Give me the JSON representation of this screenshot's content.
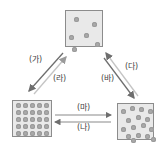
{
  "states": {
    "gas": {
      "name": "gas",
      "particles": [
        [
          8,
          6
        ],
        [
          26,
          11
        ],
        [
          3,
          24
        ],
        [
          18,
          22
        ],
        [
          6,
          36
        ],
        [
          29,
          31
        ]
      ]
    },
    "solid": {
      "name": "solid",
      "grid_rows": 5,
      "grid_cols": 5
    },
    "liquid": {
      "name": "liquid",
      "particles": [
        [
          4,
          6
        ],
        [
          13,
          3
        ],
        [
          22,
          4
        ],
        [
          31,
          6
        ],
        [
          9,
          15
        ],
        [
          19,
          12
        ],
        [
          28,
          14
        ],
        [
          4,
          24
        ],
        [
          14,
          22
        ],
        [
          24,
          20
        ],
        [
          32,
          24
        ],
        [
          9,
          31
        ],
        [
          19,
          30
        ],
        [
          28,
          31
        ],
        [
          14,
          35
        ],
        [
          34,
          34
        ]
      ]
    }
  },
  "transitions": {
    "ga": {
      "label": "(가)",
      "from": "gas",
      "to": "solid"
    },
    "ra": {
      "label": "(라)",
      "from": "solid",
      "to": "gas"
    },
    "da": {
      "label": "(다)",
      "from": "liquid",
      "to": "gas"
    },
    "ba": {
      "label": "(바)",
      "from": "gas",
      "to": "liquid"
    },
    "ma": {
      "label": "(마)",
      "from": "solid",
      "to": "liquid"
    },
    "na": {
      "label": "(나)",
      "from": "liquid",
      "to": "solid"
    }
  },
  "colors": {
    "box_fill": "#e9e9e9",
    "box_border": "#8c8c8c",
    "particle": "#a9a9a9",
    "arrow_dark": "#6e6e6e",
    "arrow_light": "#c4c4c4"
  }
}
